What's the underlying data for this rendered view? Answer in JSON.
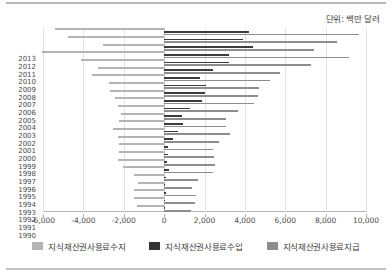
{
  "unit_note": "단위: 백만 달러",
  "legend": {
    "items": [
      {
        "key": "balance",
        "label": "지식재산권사용료수지",
        "color": "#b4b4b4"
      },
      {
        "key": "income",
        "label": "지식재산권사용료수입",
        "color": "#343434"
      },
      {
        "key": "payment",
        "label": "지식재산권사용료지급",
        "color": "#8d8d8d"
      }
    ]
  },
  "chart_data": {
    "type": "bar",
    "orientation": "horizontal",
    "title": "",
    "subtitle": "단위: 백만 달러",
    "xlabel": "",
    "ylabel": "",
    "xlim": [
      -6000,
      10000
    ],
    "xticks": [
      -6000,
      -4000,
      -2000,
      0,
      2000,
      4000,
      6000,
      8000,
      10000
    ],
    "xtick_labels": [
      "-6,000",
      "-4,000",
      "-2,000",
      "0",
      "2,000",
      "4,000",
      "6,000",
      "8,000",
      "10,000"
    ],
    "grid": true,
    "legend_position": "bottom",
    "categories": [
      "2013",
      "2012",
      "2011",
      "2010",
      "2009",
      "2008",
      "2007",
      "2006",
      "2005",
      "2004",
      "2003",
      "2002",
      "2001",
      "2000",
      "1999",
      "1998",
      "1997",
      "1996",
      "1995",
      "1994",
      "1993",
      "1992",
      "1991",
      "1990"
    ],
    "series": [
      {
        "name": "지식재산권사용료수지",
        "key": "balance",
        "color": "#b4b4b4",
        "values": [
          -5400,
          -4750,
          -3050,
          -6050,
          -4100,
          -3300,
          -3550,
          -2750,
          -2700,
          -2450,
          -2300,
          -2150,
          -2250,
          -2550,
          -2300,
          -2250,
          -2250,
          -2300,
          -2050,
          -1500,
          -1300,
          -1500,
          -1500,
          -1350
        ]
      },
      {
        "name": "지식재산권사용료수입",
        "key": "income",
        "color": "#343434",
        "values": [
          4200,
          3900,
          4400,
          3200,
          3200,
          2400,
          1800,
          2050,
          2000,
          1900,
          1300,
          880,
          920,
          680,
          420,
          200,
          200,
          150,
          250,
          110,
          60,
          70,
          60,
          50
        ]
      },
      {
        "name": "지식재산권사용료지급",
        "key": "payment",
        "color": "#8d8d8d",
        "values": [
          9650,
          8550,
          7400,
          9150,
          7300,
          5750,
          5250,
          4700,
          4650,
          4450,
          3650,
          3050,
          3050,
          3250,
          2700,
          2400,
          2450,
          2500,
          2400,
          1700,
          1400,
          1600,
          1550,
          1350
        ]
      }
    ]
  }
}
